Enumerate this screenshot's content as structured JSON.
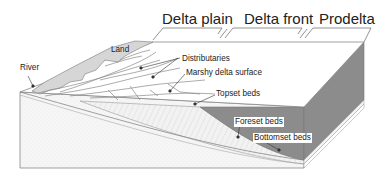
{
  "figure": {
    "zones": [
      {
        "label": "Delta plain"
      },
      {
        "label": "Delta front"
      },
      {
        "label": "Prodelta"
      }
    ],
    "labels": {
      "river": "River",
      "land": "Land",
      "distributaries": "Distributaries",
      "marshy": "Marshy delta surface",
      "topset": "Topset beds",
      "foreset": "Foreset beds",
      "bottomset": "Bottomset beds"
    },
    "colors": {
      "land_fill": "#d6d6d6",
      "prodelta_fill": "#8c8c8c",
      "outline": "#777777",
      "front_fill": "#f4f4f4"
    }
  }
}
